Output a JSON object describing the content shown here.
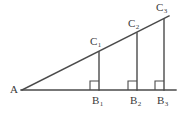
{
  "figure": {
    "type": "geometry-diagram",
    "stroke_color": "#4a4a4a",
    "text_color": "#3a3a3a",
    "background_color": "#ffffff",
    "labels": {
      "apex": "A",
      "top_points": [
        {
          "base": "C",
          "sub": "1"
        },
        {
          "base": "C",
          "sub": "2"
        },
        {
          "base": "C",
          "sub": "3"
        }
      ],
      "base_points": [
        {
          "base": "B",
          "sub": "1"
        },
        {
          "base": "B",
          "sub": "2"
        },
        {
          "base": "B",
          "sub": "3"
        }
      ]
    },
    "label_positions": {
      "apex": {
        "x": 10,
        "y": 84
      },
      "c1": {
        "x": 90,
        "y": 36
      },
      "c2": {
        "x": 128,
        "y": 18
      },
      "c3": {
        "x": 156,
        "y": 2
      },
      "b1": {
        "x": 92,
        "y": 95
      },
      "b2": {
        "x": 130,
        "y": 95
      },
      "b3": {
        "x": 157,
        "y": 95
      }
    },
    "geometry": {
      "baseline": {
        "x1": 21,
        "y1": 90,
        "x2": 176,
        "y2": 90
      },
      "hypotenuse": {
        "x1": 22,
        "y1": 90,
        "x2": 169,
        "y2": 16
      },
      "verticals": [
        {
          "x": 99,
          "y_top": 52,
          "y_bottom": 90
        },
        {
          "x": 137,
          "y_top": 33,
          "y_bottom": 90
        },
        {
          "x": 164,
          "y_top": 19,
          "y_bottom": 90
        }
      ],
      "right_angle_marks": [
        {
          "x": 90,
          "y": 81,
          "size": 9
        },
        {
          "x": 128,
          "y": 81,
          "size": 9
        },
        {
          "x": 155,
          "y": 81,
          "size": 9
        }
      ]
    }
  }
}
